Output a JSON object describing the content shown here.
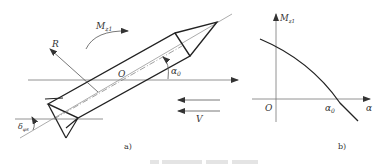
{
  "figure_a": {
    "caption": "a)",
    "labels": {
      "moment": "M",
      "moment_sub": "z1",
      "force": "R",
      "origin": "O",
      "angle": "α",
      "angle_sub": "0",
      "velocity": "V",
      "deflection": "δ",
      "deflection_sub": "φs"
    }
  },
  "figure_b": {
    "caption": "b)",
    "labels": {
      "y_axis": "M",
      "y_axis_sub": "z1",
      "x_axis": "α",
      "origin": "O",
      "zero_crossing": "α",
      "zero_crossing_sub": "0"
    }
  },
  "colors": {
    "line": "#222222",
    "thin_line": "#555555"
  }
}
